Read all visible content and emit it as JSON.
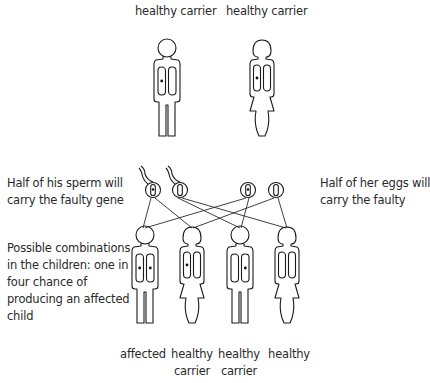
{
  "parents": {
    "father": {
      "label": "healthy carrier",
      "sex": "male",
      "faulty_genes": 1
    },
    "mother": {
      "label": "healthy carrier",
      "sex": "female",
      "faulty_genes": 1
    }
  },
  "notes": {
    "sperm": "Half of his sperm will\ncarry the faulty gene",
    "sperm_line1": "Half of his sperm will",
    "sperm_line2": "carry the faulty gene",
    "eggs_line1": "Half of her eggs will",
    "eggs_line2": "carry the faulty",
    "combinations_lines": [
      "Possible combinations",
      "in the children: one in",
      "four chance of",
      "producing  an affected",
      "child"
    ]
  },
  "gametes": [
    {
      "type": "sperm",
      "faulty": true
    },
    {
      "type": "sperm",
      "faulty": false
    },
    {
      "type": "egg",
      "faulty": true
    },
    {
      "type": "egg",
      "faulty": false
    }
  ],
  "children": [
    {
      "sex": "male",
      "faulty_genes": 2,
      "label_line1": "affected",
      "label_line2": ""
    },
    {
      "sex": "female",
      "faulty_genes": 1,
      "label_line1": "healthy",
      "label_line2": "carrier"
    },
    {
      "sex": "male",
      "faulty_genes": 1,
      "label_line1": "healthy",
      "label_line2": "carrier"
    },
    {
      "sex": "female",
      "faulty_genes": 0,
      "label_line1": "healthy",
      "label_line2": ""
    }
  ]
}
